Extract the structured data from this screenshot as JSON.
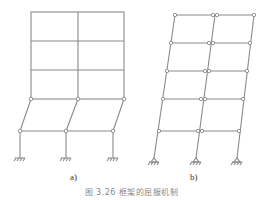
{
  "figure": {
    "caption": "图 3.26 框架的屈服机制",
    "panels": [
      {
        "label": "a)",
        "description": "Storey sway mechanism: plastic hinges form at column ends of a single storey",
        "columns": 3,
        "stories": 5,
        "mechanism": "storey"
      },
      {
        "label": "b)",
        "description": "Beam sway (overall) mechanism: plastic hinges at beam ends and column bases",
        "columns": 3,
        "stories": 5,
        "mechanism": "beam"
      }
    ],
    "colors": {
      "line": "#8a8a8a",
      "hinge_fill": "#ffffff",
      "hinge_stroke": "#8a8a8a"
    }
  }
}
